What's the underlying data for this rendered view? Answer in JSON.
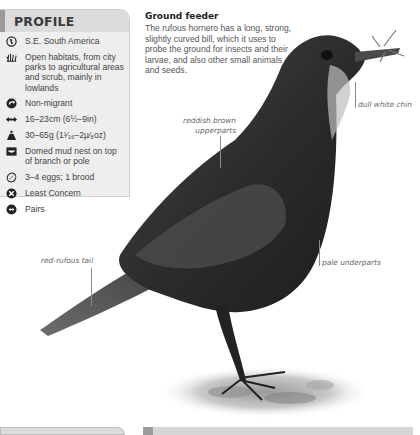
{
  "profile": {
    "title": "PROFILE",
    "items": [
      {
        "icon": "globe-icon",
        "text": "S.E. South America"
      },
      {
        "icon": "grass-habitat-icon",
        "text": "Open habitats, from city parks to agricultural areas and scrub, mainly in lowlands"
      },
      {
        "icon": "migration-arrow-icon",
        "text": "Non-migrant"
      },
      {
        "icon": "length-arrows-icon",
        "text": "16–23cm (6½–9in)"
      },
      {
        "icon": "weight-icon",
        "text": "30–65g (1¹⁄₁₆–2µ⁄₈oz)"
      },
      {
        "icon": "nest-icon",
        "text": "Domed mud nest on top of branch or pole"
      },
      {
        "icon": "egg-icon",
        "text": "3–4 eggs; 1 brood"
      },
      {
        "icon": "conservation-status-icon",
        "text": "Least Concern"
      },
      {
        "icon": "social-pairs-icon",
        "text": "Pairs"
      }
    ]
  },
  "feature": {
    "heading": "Ground feeder",
    "body": "The rufous hornero has a long, strong, slightly curved bill, which it uses to probe the ground for insects and their larvae, and also other small animals and seeds."
  },
  "annotations": {
    "chin": "dull white chin",
    "upperparts_line1": "reddish brown",
    "upperparts_line2": "upperparts",
    "tail": "red-rufous tail",
    "underparts": "pale underparts"
  },
  "colors": {
    "panel_bg": "#eeeeee",
    "panel_header": "#dcdcdc",
    "accent_bar": "#9a9a9a",
    "bird": "#2b2b2b"
  }
}
